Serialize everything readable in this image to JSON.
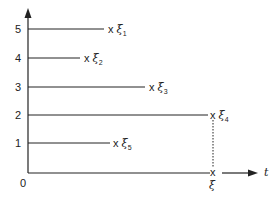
{
  "diagram": {
    "axis": {
      "x_label": "t",
      "y_ticks": [
        "0",
        "1",
        "2",
        "3",
        "4",
        "5"
      ]
    },
    "lines": [
      {
        "level": 5,
        "end_x": 108,
        "marker": "x",
        "symbol": "ξ",
        "subscript": "1"
      },
      {
        "level": 4,
        "end_x": 84,
        "marker": "x",
        "symbol": "ξ",
        "subscript": "2"
      },
      {
        "level": 3,
        "end_x": 148,
        "marker": "x",
        "symbol": "ξ",
        "subscript": "3"
      },
      {
        "level": 2,
        "end_x": 210,
        "marker": "x",
        "symbol": "ξ",
        "subscript": "4"
      },
      {
        "level": 1,
        "end_x": 112,
        "marker": "x",
        "symbol": "ξ",
        "subscript": "5"
      }
    ],
    "baseline_marker": {
      "marker": "x",
      "symbol": "ξ"
    },
    "colors": {
      "line": "#222222"
    }
  }
}
